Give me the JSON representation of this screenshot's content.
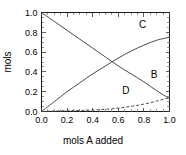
{
  "chart_data": {
    "type": "line",
    "title": "",
    "xlabel": "mols A added",
    "ylabel": "mols",
    "xlim": [
      0.0,
      1.0
    ],
    "ylim": [
      0.0,
      1.0
    ],
    "grid": false,
    "legend_position": "inline-curve-labels",
    "xticks": [
      "0.0",
      "0.2",
      "0.4",
      "0.6",
      "0.8",
      "1.0"
    ],
    "xtick_values": [
      0.0,
      0.2,
      0.4,
      0.6,
      0.8,
      1.0
    ],
    "yticks": [
      "0.0",
      "0.2",
      "0.4",
      "0.6",
      "0.8",
      "1.0"
    ],
    "ytick_values": [
      0.0,
      0.2,
      0.4,
      0.6,
      0.8,
      1.0
    ],
    "x": [
      0.0,
      0.1,
      0.2,
      0.3,
      0.4,
      0.5,
      0.6,
      0.7,
      0.8,
      0.9,
      1.0
    ],
    "series": [
      {
        "name": "C",
        "style": "solid",
        "label": "C",
        "label_x": 0.79,
        "label_y": 0.8,
        "values": [
          0.0,
          0.1,
          0.2,
          0.29,
          0.38,
          0.46,
          0.54,
          0.61,
          0.67,
          0.72,
          0.75
        ]
      },
      {
        "name": "B",
        "style": "solid",
        "label": "B",
        "label_x": 0.88,
        "label_y": 0.3,
        "values": [
          1.0,
          0.91,
          0.82,
          0.73,
          0.64,
          0.55,
          0.46,
          0.38,
          0.3,
          0.21,
          0.13
        ]
      },
      {
        "name": "D",
        "style": "dashed",
        "label": "D",
        "label_x": 0.66,
        "label_y": 0.135,
        "values": [
          0.0,
          0.005,
          0.008,
          0.011,
          0.015,
          0.022,
          0.034,
          0.052,
          0.075,
          0.105,
          0.14
        ]
      }
    ]
  },
  "colors": {
    "background": "#ffffff",
    "axis": "#1a1a1a",
    "curve": "#4a4a4a",
    "text": "#000000"
  }
}
